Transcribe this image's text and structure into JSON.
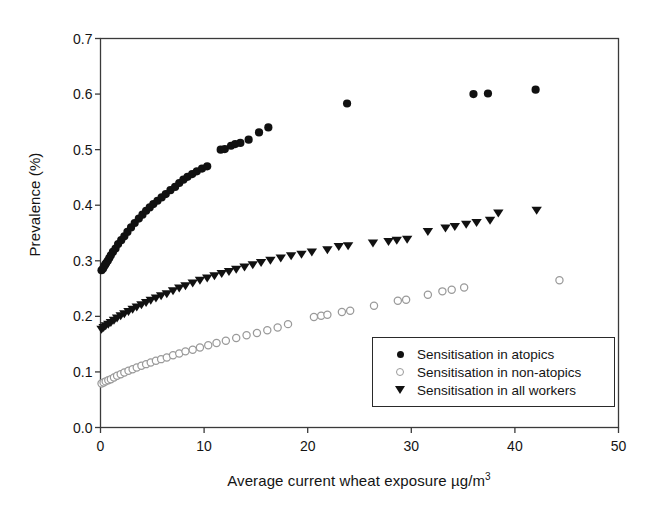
{
  "chart_data": {
    "type": "scatter",
    "title": "",
    "xlabel": "Average current wheat exposure µg/m",
    "xlabel_sup": "3",
    "ylabel": "Prevalence (%)",
    "xlim": [
      0,
      50
    ],
    "ylim": [
      0.0,
      0.7
    ],
    "xticks": [
      0,
      10,
      20,
      30,
      40,
      50
    ],
    "xtick_labels": [
      "0",
      "10",
      "20",
      "30",
      "40",
      "50"
    ],
    "yticks": [
      0.0,
      0.1,
      0.2,
      0.3,
      0.4,
      0.5,
      0.6,
      0.7
    ],
    "ytick_labels": [
      "0.0",
      "0.1",
      "0.2",
      "0.3",
      "0.4",
      "0.5",
      "0.6",
      "0.7"
    ],
    "grid": false,
    "legend_position": "lower-right-inside",
    "frame": "box",
    "series": [
      {
        "name": "Sensitisation in atopics",
        "marker": "filled-circle",
        "color": "#111111",
        "points": [
          [
            0.1,
            0.283
          ],
          [
            0.25,
            0.286
          ],
          [
            0.35,
            0.29
          ],
          [
            0.45,
            0.293
          ],
          [
            0.55,
            0.296
          ],
          [
            0.7,
            0.3
          ],
          [
            0.85,
            0.305
          ],
          [
            1.0,
            0.31
          ],
          [
            1.2,
            0.316
          ],
          [
            1.45,
            0.322
          ],
          [
            1.7,
            0.33
          ],
          [
            2.0,
            0.337
          ],
          [
            2.3,
            0.344
          ],
          [
            2.6,
            0.352
          ],
          [
            2.95,
            0.36
          ],
          [
            3.3,
            0.368
          ],
          [
            3.7,
            0.376
          ],
          [
            4.05,
            0.383
          ],
          [
            4.4,
            0.39
          ],
          [
            4.75,
            0.396
          ],
          [
            5.1,
            0.402
          ],
          [
            5.5,
            0.408
          ],
          [
            5.9,
            0.414
          ],
          [
            6.3,
            0.42
          ],
          [
            6.75,
            0.427
          ],
          [
            7.2,
            0.433
          ],
          [
            7.6,
            0.44
          ],
          [
            8.0,
            0.446
          ],
          [
            8.4,
            0.451
          ],
          [
            8.85,
            0.456
          ],
          [
            9.3,
            0.461
          ],
          [
            9.8,
            0.466
          ],
          [
            10.3,
            0.47
          ],
          [
            11.6,
            0.5
          ],
          [
            12.0,
            0.501
          ],
          [
            12.6,
            0.507
          ],
          [
            13.0,
            0.51
          ],
          [
            13.5,
            0.512
          ],
          [
            14.3,
            0.518
          ],
          [
            15.3,
            0.531
          ],
          [
            16.2,
            0.54
          ],
          [
            23.8,
            0.583
          ],
          [
            36.0,
            0.6
          ],
          [
            37.4,
            0.601
          ],
          [
            42.0,
            0.608
          ]
        ]
      },
      {
        "name": "Sensitisation in non-atopics",
        "marker": "open-circle",
        "color": "#9a9a9a",
        "points": [
          [
            0.1,
            0.079
          ],
          [
            0.3,
            0.081
          ],
          [
            0.5,
            0.083
          ],
          [
            0.75,
            0.085
          ],
          [
            1.0,
            0.087
          ],
          [
            1.3,
            0.09
          ],
          [
            1.6,
            0.093
          ],
          [
            1.95,
            0.096
          ],
          [
            2.3,
            0.099
          ],
          [
            2.7,
            0.102
          ],
          [
            3.1,
            0.105
          ],
          [
            3.5,
            0.108
          ],
          [
            3.95,
            0.111
          ],
          [
            4.4,
            0.114
          ],
          [
            4.85,
            0.117
          ],
          [
            5.35,
            0.12
          ],
          [
            5.85,
            0.123
          ],
          [
            6.4,
            0.126
          ],
          [
            7.0,
            0.13
          ],
          [
            7.6,
            0.133
          ],
          [
            8.2,
            0.137
          ],
          [
            8.9,
            0.14
          ],
          [
            9.6,
            0.144
          ],
          [
            10.4,
            0.148
          ],
          [
            11.2,
            0.152
          ],
          [
            12.1,
            0.156
          ],
          [
            13.1,
            0.161
          ],
          [
            14.1,
            0.166
          ],
          [
            15.1,
            0.17
          ],
          [
            16.1,
            0.175
          ],
          [
            17.1,
            0.18
          ],
          [
            18.1,
            0.186
          ],
          [
            20.6,
            0.199
          ],
          [
            21.3,
            0.201
          ],
          [
            21.9,
            0.203
          ],
          [
            23.3,
            0.208
          ],
          [
            24.1,
            0.21
          ],
          [
            26.4,
            0.219
          ],
          [
            28.7,
            0.228
          ],
          [
            29.5,
            0.23
          ],
          [
            31.6,
            0.239
          ],
          [
            33.0,
            0.245
          ],
          [
            33.9,
            0.248
          ],
          [
            35.1,
            0.252
          ],
          [
            44.3,
            0.265
          ]
        ]
      },
      {
        "name": "Sensitisation in all workers",
        "marker": "filled-triangle-down",
        "color": "#111111",
        "points": [
          [
            0.1,
            0.176
          ],
          [
            0.3,
            0.179
          ],
          [
            0.5,
            0.182
          ],
          [
            0.75,
            0.185
          ],
          [
            1.0,
            0.188
          ],
          [
            1.3,
            0.192
          ],
          [
            1.6,
            0.196
          ],
          [
            1.95,
            0.2
          ],
          [
            2.3,
            0.204
          ],
          [
            2.7,
            0.208
          ],
          [
            3.1,
            0.212
          ],
          [
            3.5,
            0.216
          ],
          [
            3.95,
            0.22
          ],
          [
            4.4,
            0.224
          ],
          [
            4.85,
            0.228
          ],
          [
            5.35,
            0.232
          ],
          [
            5.85,
            0.236
          ],
          [
            6.4,
            0.24
          ],
          [
            7.0,
            0.245
          ],
          [
            7.6,
            0.25
          ],
          [
            8.2,
            0.254
          ],
          [
            8.9,
            0.259
          ],
          [
            9.6,
            0.264
          ],
          [
            10.3,
            0.268
          ],
          [
            11.0,
            0.272
          ],
          [
            11.7,
            0.276
          ],
          [
            12.4,
            0.28
          ],
          [
            13.1,
            0.284
          ],
          [
            13.9,
            0.288
          ],
          [
            14.7,
            0.292
          ],
          [
            15.5,
            0.296
          ],
          [
            16.4,
            0.3
          ],
          [
            17.4,
            0.304
          ],
          [
            18.4,
            0.308
          ],
          [
            19.4,
            0.311
          ],
          [
            20.4,
            0.315
          ],
          [
            21.9,
            0.319
          ],
          [
            23.0,
            0.325
          ],
          [
            23.9,
            0.326
          ],
          [
            26.3,
            0.331
          ],
          [
            27.8,
            0.334
          ],
          [
            28.6,
            0.336
          ],
          [
            29.6,
            0.338
          ],
          [
            31.6,
            0.352
          ],
          [
            33.3,
            0.358
          ],
          [
            34.2,
            0.361
          ],
          [
            35.3,
            0.365
          ],
          [
            36.3,
            0.368
          ],
          [
            37.6,
            0.372
          ],
          [
            38.4,
            0.385
          ],
          [
            42.1,
            0.39
          ]
        ]
      }
    ]
  },
  "legend": {
    "items": [
      {
        "label": "Sensitisation in atopics",
        "marker": "filled-circle"
      },
      {
        "label": "Sensitisation in non-atopics",
        "marker": "open-circle"
      },
      {
        "label": "Sensitisation in all workers",
        "marker": "filled-triangle-down"
      }
    ]
  }
}
